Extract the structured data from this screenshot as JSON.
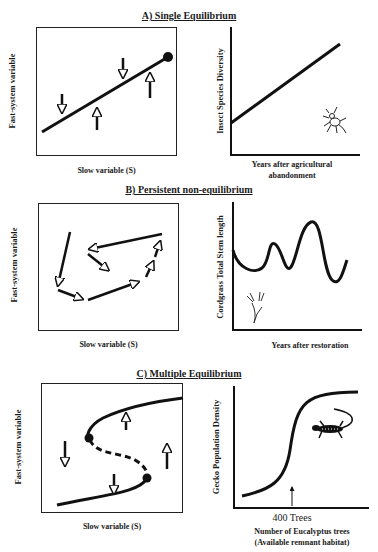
{
  "panels": {
    "a": {
      "title": "A) Single Equilibrium",
      "left": {
        "ylabel": "Fast-system variable",
        "xlabel": "Slow variable (S)"
      },
      "right": {
        "ylabel": "Insect Species Diversity",
        "xlabel_line1": "Years after agricultural",
        "xlabel_line2": "abandonment",
        "icon": "insect-icon"
      }
    },
    "b": {
      "title": "B) Persistent non-equilibrium",
      "left": {
        "ylabel": "Fast-system variable",
        "xlabel": "Slow variable (S)"
      },
      "right": {
        "ylabel": "Cordgrass Total Stem length",
        "xlabel": "Years after restoration",
        "icon": "cordgrass-icon"
      }
    },
    "c": {
      "title": "C) Multiple Equilibrium",
      "left": {
        "ylabel": "Fast-system variable",
        "xlabel": "Slow variable (S)"
      },
      "right": {
        "ylabel": "Gecko Population Density",
        "threshold_label": "400 Trees",
        "xlabel_line1": "Number of Eucalyptus trees",
        "xlabel_line2": "(Available remnant habitat)",
        "icon": "gecko-icon"
      }
    }
  }
}
